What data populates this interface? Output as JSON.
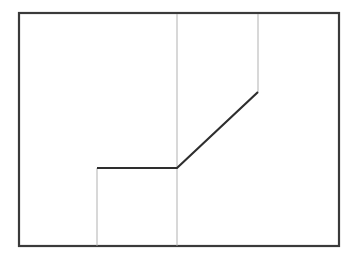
{
  "canvas": {
    "width": 351,
    "height": 261,
    "background": "#ffffff"
  },
  "frame": {
    "x": 19,
    "y": 13,
    "width": 320,
    "height": 233,
    "stroke": "#3a3a3a",
    "stroke_width": 2.2
  },
  "guide_lines": [
    {
      "id": "guide-left",
      "x1": 97,
      "y1": 168,
      "x2": 97,
      "y2": 246,
      "stroke": "#a8a8a8",
      "stroke_width": 0.9
    },
    {
      "id": "guide-middle",
      "x1": 177,
      "y1": 14,
      "x2": 177,
      "y2": 246,
      "stroke": "#a8a8a8",
      "stroke_width": 0.9
    },
    {
      "id": "guide-right",
      "x1": 258,
      "y1": 14,
      "x2": 258,
      "y2": 92,
      "stroke": "#a8a8a8",
      "stroke_width": 0.9
    }
  ],
  "profile_line": {
    "points": [
      [
        97,
        168
      ],
      [
        177,
        168
      ],
      [
        258,
        92
      ]
    ],
    "stroke": "#2e2e2e",
    "stroke_width": 2.2
  }
}
